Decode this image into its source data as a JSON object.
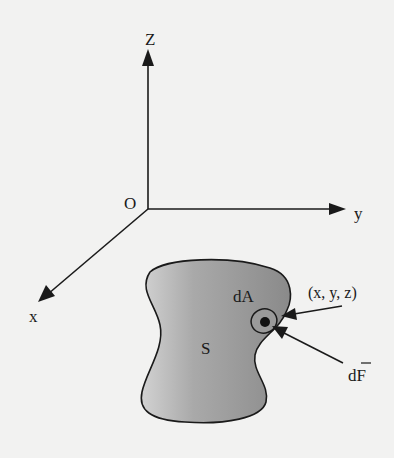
{
  "diagram": {
    "axes": {
      "origin_label": "O",
      "z_label": "Z",
      "y_label": "y",
      "x_label": "x"
    },
    "surface": {
      "label": "S",
      "fill_light": "#cfcfcf",
      "fill_dark": "#8e8e8e"
    },
    "area_element": {
      "label": "dA"
    },
    "point": {
      "label": "(x, y, z)"
    },
    "force": {
      "label": "dF",
      "overbar": true
    },
    "colors": {
      "background": "#f2f2f1",
      "ink": "#1a1a1a"
    }
  }
}
